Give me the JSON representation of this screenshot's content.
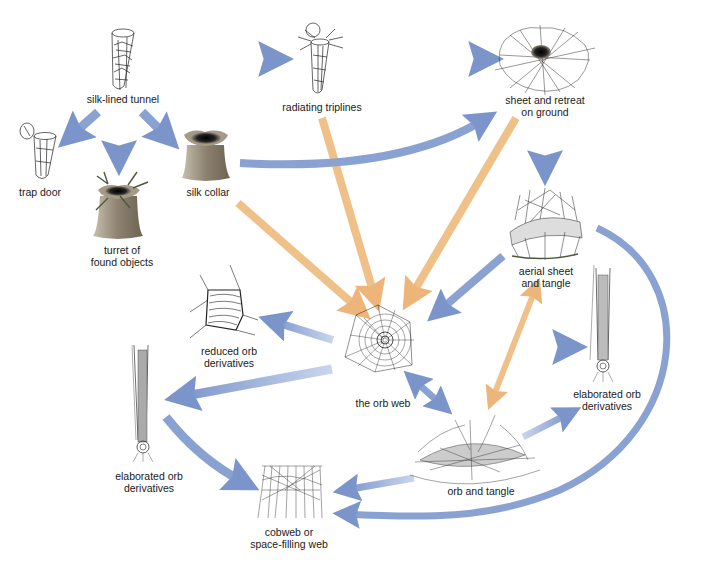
{
  "diagram": {
    "type": "evolutionary web-type flow diagram",
    "colors": {
      "blue_arrow": "#7f98cc",
      "blue_arrow_light": "#c5d2ea",
      "orange_arrow": "#f0c089",
      "ink": "#1a1a1a",
      "collar_fill": "#8f8574",
      "background": "#ffffff"
    },
    "nodes": {
      "silk_lined_tunnel": {
        "label": "silk-lined tunnel"
      },
      "radiating_triplines": {
        "label": "radiating triplines"
      },
      "sheet_retreat": {
        "label_line1": "sheet and retreat",
        "label_line2": "on ground"
      },
      "trap_door": {
        "label": "trap door"
      },
      "turret": {
        "label_line1": "turret of",
        "label_line2": "found objects"
      },
      "silk_collar": {
        "label": "silk collar"
      },
      "aerial_sheet": {
        "label_line1": "aerial sheet",
        "label_line2": "and tangle"
      },
      "reduced_orb": {
        "label_line1": "reduced orb",
        "label_line2": "derivatives"
      },
      "orb_web": {
        "label": "the orb web"
      },
      "elaborated_orb_right": {
        "label_line1": "elaborated orb",
        "label_line2": "derivatives"
      },
      "elaborated_orb_left": {
        "label_line1": "elaborated orb",
        "label_line2": "derivatives"
      },
      "orb_tangle": {
        "label": "orb and tangle"
      },
      "cobweb": {
        "label_line1": "cobweb or",
        "label_line2": "space-filling web"
      }
    },
    "edges": [
      {
        "from": "silk-lined tunnel",
        "to": "radiating triplines",
        "color": "blue"
      },
      {
        "from": "radiating triplines",
        "to": "sheet and retreat on ground",
        "color": "blue"
      },
      {
        "from": "silk-lined tunnel",
        "to": "trap door",
        "color": "blue"
      },
      {
        "from": "silk-lined tunnel",
        "to": "turret of found objects",
        "color": "blue"
      },
      {
        "from": "silk-lined tunnel",
        "to": "silk collar",
        "color": "blue"
      },
      {
        "from": "silk collar",
        "to": "sheet and retreat on ground",
        "color": "blue"
      },
      {
        "from": "sheet and retreat on ground",
        "to": "aerial sheet and tangle",
        "color": "blue"
      },
      {
        "from": "silk collar",
        "to": "the orb web",
        "color": "orange"
      },
      {
        "from": "radiating triplines",
        "to": "the orb web",
        "color": "orange"
      },
      {
        "from": "sheet and retreat on ground",
        "to": "the orb web",
        "color": "orange"
      },
      {
        "from": "aerial sheet and tangle",
        "to": "the orb web",
        "color": "blue"
      },
      {
        "from": "the orb web",
        "to": "reduced orb derivatives",
        "color": "blue"
      },
      {
        "from": "the orb web",
        "to": "elaborated orb derivatives (left)",
        "color": "blue"
      },
      {
        "from": "the orb web",
        "to": "elaborated orb derivatives (right)",
        "color": "blue"
      },
      {
        "from": "the orb web",
        "to": "orb and tangle",
        "color": "blue",
        "bidirectional": true
      },
      {
        "from": "aerial sheet and tangle",
        "to": "orb and tangle",
        "color": "orange",
        "bidirectional": true
      },
      {
        "from": "orb and tangle",
        "to": "elaborated orb derivatives (right)",
        "color": "blue"
      },
      {
        "from": "orb and tangle",
        "to": "cobweb or space-filling web",
        "color": "blue"
      },
      {
        "from": "elaborated orb derivatives (left)",
        "to": "cobweb or space-filling web",
        "color": "blue"
      },
      {
        "from": "aerial sheet and tangle",
        "to": "cobweb or space-filling web",
        "color": "blue",
        "curved": true
      }
    ]
  }
}
